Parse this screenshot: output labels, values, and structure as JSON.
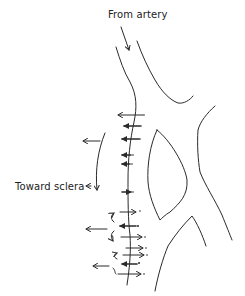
{
  "diagram": {
    "labels": {
      "from_artery": "From artery",
      "toward_sclera": "Toward sclera"
    },
    "colors": {
      "line": "#2a2a2a",
      "background": "#ffffff"
    },
    "elements": [
      {
        "name": "inflow-arrow",
        "description": "arrow pointing down into vessel from artery label"
      },
      {
        "name": "vessel-wall-left",
        "description": "curved left wall of vessel with crossing arrows"
      },
      {
        "name": "vessel-wall-right",
        "description": "right wall branching into bifurcation"
      },
      {
        "name": "lumen-island",
        "description": "leaf-shaped region between branches"
      },
      {
        "name": "outflow-arrows-left",
        "description": "arrows pointing left toward sclera"
      },
      {
        "name": "inflow-arrows-right",
        "description": "arrows pointing right across wall near bottom"
      },
      {
        "name": "recirculation-curls",
        "description": "small curved arrows indicating looping flow"
      }
    ]
  }
}
